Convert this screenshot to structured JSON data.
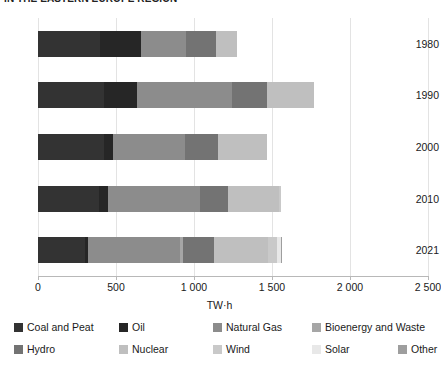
{
  "chart_data": {
    "type": "bar",
    "orientation": "horizontal",
    "stacked": true,
    "title": "IN THE EASTERN EUROPE REGION",
    "xlabel": "TW·h",
    "ylabel": "",
    "xlim": [
      0,
      2500
    ],
    "xticks": [
      0,
      500,
      1000,
      1500,
      2000,
      2500
    ],
    "xtick_labels": [
      "0",
      "500",
      "1 000",
      "1 500",
      "2 000",
      "2 500"
    ],
    "grid": true,
    "legend_position": "bottom",
    "categories": [
      "1980",
      "1990",
      "2000",
      "2010",
      "2021"
    ],
    "series": [
      {
        "name": "Coal and Peat",
        "color": "#333333",
        "values": [
          400,
          420,
          420,
          390,
          300
        ]
      },
      {
        "name": "Oil",
        "color": "#262626",
        "values": [
          260,
          215,
          60,
          60,
          20
        ]
      },
      {
        "name": "Natural Gas",
        "color": "#8c8c8c",
        "values": [
          290,
          610,
          460,
          590,
          590
        ]
      },
      {
        "name": "Bioenergy and Waste",
        "color": "#a6a6a6",
        "values": [
          0,
          0,
          0,
          0,
          20
        ]
      },
      {
        "name": "Hydro",
        "color": "#737373",
        "values": [
          190,
          225,
          215,
          175,
          200
        ]
      },
      {
        "name": "Nuclear",
        "color": "#bfbfbf",
        "values": [
          135,
          300,
          310,
          330,
          345
        ]
      },
      {
        "name": "Wind",
        "color": "#c9c9c9",
        "values": [
          0,
          0,
          0,
          10,
          60
        ]
      },
      {
        "name": "Solar",
        "color": "#e8e8e8",
        "values": [
          0,
          0,
          0,
          0,
          20
        ]
      },
      {
        "name": "Other",
        "color": "#9e9e9e",
        "values": [
          0,
          0,
          0,
          0,
          10
        ]
      }
    ],
    "totals": [
      1275,
      1770,
      1465,
      1555,
      1565
    ]
  },
  "legend": {
    "row1": [
      {
        "label": "Coal and Peat",
        "color": "#333333",
        "left": 14
      },
      {
        "label": "Oil",
        "color": "#262626",
        "left": 119
      },
      {
        "label": "Natural Gas",
        "color": "#8c8c8c",
        "left": 213
      },
      {
        "label": "Bioenergy and Waste",
        "color": "#a6a6a6",
        "left": 312
      }
    ],
    "row2": [
      {
        "label": "Hydro",
        "color": "#737373",
        "left": 14
      },
      {
        "label": "Nuclear",
        "color": "#bfbfbf",
        "left": 119
      },
      {
        "label": "Wind",
        "color": "#c9c9c9",
        "left": 213
      },
      {
        "label": "Solar",
        "color": "#e8e8e8",
        "left": 312
      },
      {
        "label": "Other",
        "color": "#9e9e9e",
        "left": 398
      }
    ]
  }
}
